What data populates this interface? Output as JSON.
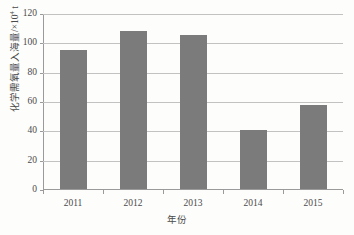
{
  "chart_data": {
    "type": "bar",
    "title": "",
    "categories": [
      "2011",
      "2012",
      "2013",
      "2014",
      "2015"
    ],
    "values": [
      94.5,
      108,
      105,
      40,
      57.5
    ],
    "series": [
      {
        "name": "化学需氧量入海量",
        "values": [
          94.5,
          108,
          105,
          40,
          57.5
        ]
      }
    ],
    "xlabel": "年份",
    "ylabel_text": "化学需氧量入海量/×10",
    "ylabel_exponent": "4",
    "ylabel_unit": " t",
    "ylim": [
      0,
      120
    ],
    "yticks": [
      "0",
      "20",
      "40",
      "60",
      "80",
      "100",
      "120"
    ],
    "ytick_values": [
      0,
      20,
      40,
      60,
      80,
      100,
      120
    ],
    "grid": "horizontal",
    "legend": "none",
    "bar_color": "#7b7b7b",
    "gridline_color": "#c2c2c2",
    "axis_color": "#9a9a9a",
    "text_color": "#4a4a4a",
    "background_color": "#fdfdfc"
  }
}
